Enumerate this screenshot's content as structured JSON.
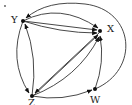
{
  "diagram": {
    "type": "directed-graph",
    "nodes": [
      {
        "id": "Y",
        "label": "Y",
        "x": 23,
        "y": 21,
        "label_x": 11,
        "label_y": 23
      },
      {
        "id": "X",
        "label": "X",
        "x": 100,
        "y": 31,
        "label_x": 107,
        "label_y": 32
      },
      {
        "id": "Z",
        "label": "Z",
        "x": 32,
        "y": 96,
        "label_x": 28,
        "label_y": 106
      },
      {
        "id": "W",
        "label": "W",
        "x": 95,
        "y": 89,
        "label_x": 90,
        "label_y": 103
      }
    ],
    "edges": [
      {
        "from": "Y",
        "to": "X",
        "shape": "upper-arc"
      },
      {
        "from": "Y",
        "to": "X",
        "shape": "straight"
      },
      {
        "from": "Y",
        "to": "X",
        "shape": "lower-arc"
      },
      {
        "from": "Y",
        "to": "Z",
        "shape": "left-arc"
      },
      {
        "from": "Z",
        "to": "Y",
        "shape": "right-arc"
      },
      {
        "from": "X",
        "to": "Z",
        "shape": "straight"
      },
      {
        "from": "Z",
        "to": "X",
        "shape": "straight"
      },
      {
        "from": "Z",
        "to": "X",
        "shape": "lower-arc"
      },
      {
        "from": "Z",
        "to": "W",
        "shape": "arc"
      },
      {
        "from": "W",
        "to": "X",
        "shape": "arc"
      },
      {
        "from": "W",
        "to": "Y",
        "shape": "outer-arc"
      }
    ],
    "colors": {
      "edge": "#333333",
      "node": "#111111",
      "background": "#ffffff"
    }
  }
}
